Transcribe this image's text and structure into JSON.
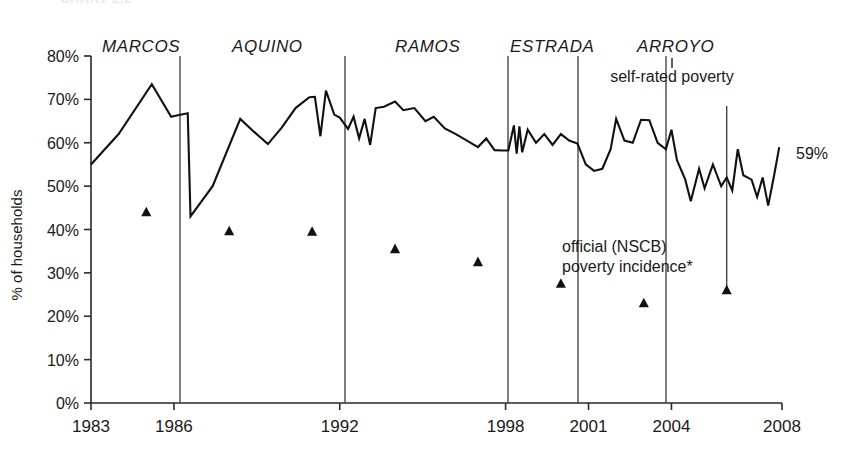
{
  "figure": {
    "clipped_header": "CHART 2.2",
    "end_value_label": "59%",
    "ylabel": "% of households"
  },
  "annotations": [
    {
      "id": "self-rated",
      "text": "self-rated poverty",
      "x": 672,
      "y": 82,
      "anchor": "middle",
      "leader": {
        "x1": 672,
        "y1": 58,
        "x2": 672,
        "y2": 68
      }
    },
    {
      "id": "official-1",
      "text": "official (NSCB)",
      "x": 562,
      "y": 252,
      "anchor": "start",
      "leader": null
    },
    {
      "id": "official-2",
      "text": "poverty incidence*",
      "x": 562,
      "y": 272,
      "anchor": "start",
      "leader": null
    }
  ],
  "eras": [
    {
      "label": "MARCOS",
      "label_x": 102,
      "divider_x": 180
    },
    {
      "label": "AQUINO",
      "label_x": 232,
      "divider_x": 345
    },
    {
      "label": "RAMOS",
      "label_x": 395,
      "divider_x": 508
    },
    {
      "label": "ESTRADA",
      "label_x": 510,
      "divider_x": 578
    },
    {
      "label": "ARROYO",
      "label_x": 637,
      "divider_x": 666
    }
  ],
  "chart_data": {
    "type": "line",
    "xlabel": "",
    "ylabel": "% of households",
    "xlim": [
      1983,
      2008
    ],
    "ylim": [
      0,
      80
    ],
    "grid": false,
    "legend": "annotated-inline",
    "ytick_labels": [
      "0%",
      "10%",
      "20%",
      "30%",
      "40%",
      "50%",
      "60%",
      "70%",
      "80%"
    ],
    "ytick_values": [
      0,
      10,
      20,
      30,
      40,
      50,
      60,
      70,
      80
    ],
    "xtick_labels": [
      "1983",
      "1986",
      "1992",
      "1998",
      "2001",
      "2004",
      "2008"
    ],
    "xtick_values": [
      1983,
      1986,
      1992,
      1998,
      2001,
      2004,
      2008
    ],
    "series": [
      {
        "name": "self-rated poverty",
        "kind": "line",
        "points": [
          [
            1983.0,
            55.0
          ],
          [
            1984.0,
            62.0
          ],
          [
            1985.2,
            73.5
          ],
          [
            1985.9,
            66.0
          ],
          [
            1986.1,
            66.3
          ],
          [
            1986.5,
            66.8
          ],
          [
            1986.6,
            43.0
          ],
          [
            1987.4,
            50.0
          ],
          [
            1988.4,
            65.5
          ],
          [
            1988.9,
            62.5
          ],
          [
            1989.4,
            59.7
          ],
          [
            1989.9,
            63.5
          ],
          [
            1990.4,
            68.0
          ],
          [
            1990.9,
            70.5
          ],
          [
            1991.1,
            70.6
          ],
          [
            1991.3,
            61.5
          ],
          [
            1991.5,
            72.0
          ],
          [
            1991.8,
            66.5
          ],
          [
            1992.0,
            65.8
          ],
          [
            1992.3,
            63.2
          ],
          [
            1992.5,
            66.0
          ],
          [
            1992.7,
            61.0
          ],
          [
            1992.9,
            65.5
          ],
          [
            1993.1,
            59.5
          ],
          [
            1993.3,
            68.0
          ],
          [
            1993.6,
            68.3
          ],
          [
            1994.0,
            69.5
          ],
          [
            1994.3,
            67.5
          ],
          [
            1994.7,
            68.0
          ],
          [
            1995.1,
            65.0
          ],
          [
            1995.4,
            66.0
          ],
          [
            1995.8,
            63.3
          ],
          [
            1996.2,
            62.0
          ],
          [
            1996.6,
            60.5
          ],
          [
            1997.0,
            59.0
          ],
          [
            1997.3,
            61.0
          ],
          [
            1997.6,
            58.3
          ],
          [
            1997.9,
            58.2
          ],
          [
            1998.1,
            58.2
          ],
          [
            1998.3,
            64.0
          ],
          [
            1998.4,
            57.5
          ],
          [
            1998.5,
            63.8
          ],
          [
            1998.6,
            57.8
          ],
          [
            1998.8,
            63.0
          ],
          [
            1999.1,
            60.0
          ],
          [
            1999.4,
            62.0
          ],
          [
            1999.7,
            59.5
          ],
          [
            2000.0,
            62.0
          ],
          [
            2000.3,
            60.5
          ],
          [
            2000.6,
            59.8
          ],
          [
            2000.9,
            55.0
          ],
          [
            2001.2,
            53.5
          ],
          [
            2001.5,
            54.0
          ],
          [
            2001.8,
            58.5
          ],
          [
            2002.0,
            65.5
          ],
          [
            2002.3,
            60.5
          ],
          [
            2002.6,
            60.0
          ],
          [
            2002.9,
            65.3
          ],
          [
            2003.2,
            65.2
          ],
          [
            2003.5,
            60.0
          ],
          [
            2003.8,
            58.5
          ],
          [
            2004.0,
            63.0
          ],
          [
            2004.2,
            56.0
          ],
          [
            2004.5,
            51.5
          ],
          [
            2004.7,
            46.5
          ],
          [
            2005.0,
            54.0
          ],
          [
            2005.2,
            49.5
          ],
          [
            2005.5,
            55.0
          ],
          [
            2005.8,
            50.0
          ],
          [
            2006.0,
            52.0
          ],
          [
            2006.2,
            49.0
          ],
          [
            2006.4,
            58.5
          ],
          [
            2006.6,
            52.5
          ],
          [
            2006.9,
            51.5
          ],
          [
            2007.1,
            47.5
          ],
          [
            2007.3,
            52.0
          ],
          [
            2007.5,
            45.5
          ],
          [
            2007.7,
            52.0
          ],
          [
            2007.9,
            59.0
          ]
        ]
      },
      {
        "name": "official (NSCB) poverty incidence*",
        "kind": "scatter-triangle",
        "points": [
          [
            1985.0,
            44.0
          ],
          [
            1988.0,
            39.6
          ],
          [
            1991.0,
            39.5
          ],
          [
            1994.0,
            35.5
          ],
          [
            1997.0,
            32.5
          ],
          [
            2000.0,
            27.5
          ],
          [
            2003.0,
            23.0
          ],
          [
            2006.0,
            26.0
          ]
        ]
      }
    ],
    "extra_marks": [
      {
        "id": "arroyo-divider-2006",
        "type": "vline",
        "x": 2006.0,
        "y_top": 68.5,
        "y_bottom": 25.5
      }
    ]
  }
}
